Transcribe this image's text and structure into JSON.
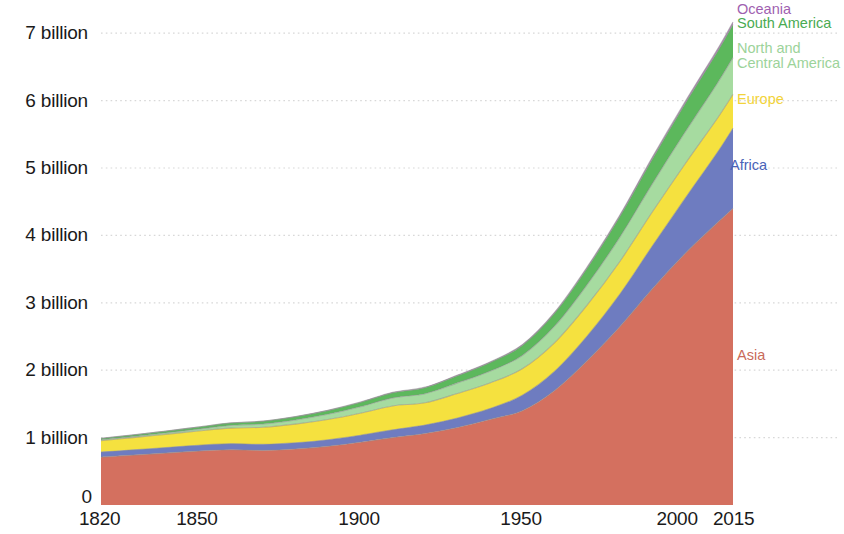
{
  "chart_data": {
    "type": "area",
    "stacked": true,
    "title": "",
    "subtitle": "",
    "xlabel": "",
    "ylabel": "",
    "grid": true,
    "gridlines_axis": "y",
    "legend_position": "right-inline",
    "xlim": [
      1820,
      2015
    ],
    "ylim": [
      0,
      7400000000
    ],
    "y_tick_labels": [
      "0",
      "1 billion",
      "2 billion",
      "3 billion",
      "4 billion",
      "5 billion",
      "6 billion",
      "7 billion"
    ],
    "y_tick_values": [
      0,
      1000000000,
      2000000000,
      3000000000,
      4000000000,
      5000000000,
      6000000000,
      7000000000
    ],
    "x_tick_labels": [
      "1820",
      "1850",
      "1900",
      "1950",
      "2000",
      "2015"
    ],
    "x_tick_values": [
      1820,
      1850,
      1900,
      1950,
      2000,
      2015
    ],
    "x": [
      1820,
      1830,
      1840,
      1850,
      1860,
      1870,
      1880,
      1890,
      1900,
      1910,
      1920,
      1930,
      1940,
      1950,
      1960,
      1970,
      1980,
      1990,
      2000,
      2010,
      2015
    ],
    "series": [
      {
        "name": "Asia",
        "color": "#d4705f",
        "label_color": "#c96a5a",
        "values": [
          0.71,
          0.74,
          0.77,
          0.8,
          0.82,
          0.81,
          0.83,
          0.87,
          0.93,
          1.0,
          1.06,
          1.15,
          1.27,
          1.4,
          1.7,
          2.14,
          2.64,
          3.2,
          3.72,
          4.18,
          4.4
        ]
      },
      {
        "name": "Africa",
        "color": "#6e7cc0",
        "label_color": "#4a63b8",
        "values": [
          0.075,
          0.078,
          0.082,
          0.086,
          0.09,
          0.091,
          0.094,
          0.098,
          0.106,
          0.115,
          0.126,
          0.141,
          0.16,
          0.228,
          0.285,
          0.366,
          0.482,
          0.635,
          0.814,
          1.039,
          1.19
        ]
      },
      {
        "name": "Europe",
        "color": "#f5e13f",
        "label_color": "#f2d33a",
        "values": [
          0.169,
          0.182,
          0.196,
          0.212,
          0.231,
          0.252,
          0.276,
          0.3,
          0.325,
          0.355,
          0.33,
          0.364,
          0.38,
          0.393,
          0.425,
          0.46,
          0.484,
          0.504,
          0.511,
          0.505,
          0.503
        ]
      },
      {
        "name": "North and Central America",
        "color": "#a6dba0",
        "label_color": "#9cd39a",
        "values": [
          0.012,
          0.015,
          0.02,
          0.026,
          0.039,
          0.048,
          0.062,
          0.078,
          0.096,
          0.119,
          0.135,
          0.157,
          0.175,
          0.198,
          0.246,
          0.303,
          0.36,
          0.418,
          0.47,
          0.519,
          0.545
        ]
      },
      {
        "name": "South America",
        "color": "#5cb85c",
        "label_color": "#4aab52",
        "values": [
          0.021,
          0.024,
          0.027,
          0.031,
          0.035,
          0.04,
          0.046,
          0.054,
          0.063,
          0.075,
          0.089,
          0.106,
          0.126,
          0.148,
          0.191,
          0.244,
          0.306,
          0.367,
          0.42,
          0.466,
          0.49
        ]
      },
      {
        "name": "Oceania",
        "color": "#b97fc0",
        "label_color": "#a05fb0",
        "values": [
          0.0022,
          0.0023,
          0.0024,
          0.0025,
          0.003,
          0.0036,
          0.0043,
          0.0052,
          0.0062,
          0.0075,
          0.0087,
          0.0102,
          0.0114,
          0.0128,
          0.0158,
          0.0197,
          0.023,
          0.0269,
          0.0311,
          0.0367,
          0.0396
        ]
      }
    ],
    "units": "billions of people",
    "legend": [
      {
        "label": "Oceania",
        "color": "#a05fb0"
      },
      {
        "label": "South America",
        "color": "#4aab52"
      },
      {
        "label": "North and",
        "color": "#9cd39a"
      },
      {
        "label": "Central America",
        "color": "#9cd39a"
      },
      {
        "label": "Europe",
        "color": "#f2d33a"
      },
      {
        "label": "Africa",
        "color": "#4a63b8"
      },
      {
        "label": "Asia",
        "color": "#c96a5a"
      }
    ]
  },
  "axis": {
    "y_labels": [
      {
        "text": "7 billion",
        "value": 7
      },
      {
        "text": "6 billion",
        "value": 6
      },
      {
        "text": "5 billion",
        "value": 5
      },
      {
        "text": "4 billion",
        "value": 4
      },
      {
        "text": "3 billion",
        "value": 3
      },
      {
        "text": "2 billion",
        "value": 2
      },
      {
        "text": "1 billion",
        "value": 1
      },
      {
        "text": "0",
        "value": 0
      }
    ],
    "x_labels": [
      {
        "text": "1820",
        "value": 1820
      },
      {
        "text": "1850",
        "value": 1850
      },
      {
        "text": "1900",
        "value": 1900
      },
      {
        "text": "1950",
        "value": 1950
      },
      {
        "text": "2000",
        "value": 2000
      },
      {
        "text": "2015",
        "value": 2015
      }
    ]
  },
  "labels": {
    "oceania": "Oceania",
    "south_america": "South America",
    "north_central_america_line1": "North and",
    "north_central_america_line2": "Central America",
    "europe": "Europe",
    "africa": "Africa",
    "asia": "Asia"
  },
  "colors": {
    "asia": "#d4705f",
    "africa": "#6e7cc0",
    "europe": "#f5e13f",
    "north_central_america": "#a6dba0",
    "south_america": "#5cb85c",
    "oceania": "#b97fc0",
    "gridline": "#d8d8d8",
    "outline": "#8d8d8d",
    "text": "#1a1a1a",
    "background": "#ffffff"
  }
}
